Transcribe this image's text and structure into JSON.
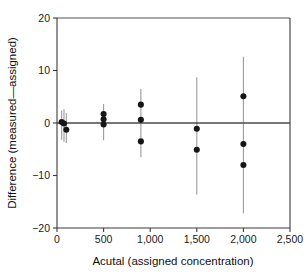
{
  "chart_data": {
    "type": "scatter",
    "title": "",
    "xlabel": "Acutal (assigned concentration)",
    "ylabel": "Difference (measured—assigned)",
    "xlim": [
      0,
      2500
    ],
    "ylim": [
      -20,
      20
    ],
    "xticks": [
      0,
      500,
      1000,
      1500,
      2000,
      2500
    ],
    "xtick_labels": [
      "0",
      "500",
      "1,000",
      "1,500",
      "2,000",
      "2,500"
    ],
    "yticks": [
      20,
      10,
      0,
      -10,
      -20
    ],
    "ytick_labels": [
      "20",
      "10",
      "0",
      "−10",
      "−20"
    ],
    "grid": false,
    "legend": null,
    "reference_line": {
      "y": 0,
      "label": "zero difference line"
    },
    "marker": {
      "shape": "circle",
      "color": "#161616",
      "size": 4.4
    },
    "errorbar": {
      "color": "#9a9a9a",
      "capped": false
    },
    "points": [
      {
        "x": 50,
        "y": 0.2,
        "yerr_low": -3.2,
        "yerr_high": 2.4
      },
      {
        "x": 75,
        "y": -0.1,
        "yerr_low": -3.6,
        "yerr_high": 2.6
      },
      {
        "x": 100,
        "y": -1.3,
        "yerr_low": -3.8,
        "yerr_high": 1.9
      },
      {
        "x": 500,
        "y": 1.7,
        "yerr_low": -3.3,
        "yerr_high": 3.6
      },
      {
        "x": 500,
        "y": 0.7,
        "yerr_low": -3.3,
        "yerr_high": 3.6
      },
      {
        "x": 500,
        "y": -0.3,
        "yerr_low": -3.3,
        "yerr_high": 3.6
      },
      {
        "x": 900,
        "y": 3.5,
        "yerr_low": -6.5,
        "yerr_high": 6.5
      },
      {
        "x": 900,
        "y": 0.6,
        "yerr_low": -6.5,
        "yerr_high": 6.5
      },
      {
        "x": 900,
        "y": -3.5,
        "yerr_low": -6.5,
        "yerr_high": 6.5
      },
      {
        "x": 1500,
        "y": -1.1,
        "yerr_low": -13.6,
        "yerr_high": 8.7
      },
      {
        "x": 1500,
        "y": -5.1,
        "yerr_low": -13.6,
        "yerr_high": 8.7
      },
      {
        "x": 2000,
        "y": 5.1,
        "yerr_low": -17.2,
        "yerr_high": 12.6
      },
      {
        "x": 2000,
        "y": -4.0,
        "yerr_low": -17.2,
        "yerr_high": 12.6
      },
      {
        "x": 2000,
        "y": -8.0,
        "yerr_low": -17.2,
        "yerr_high": 12.6
      }
    ]
  }
}
